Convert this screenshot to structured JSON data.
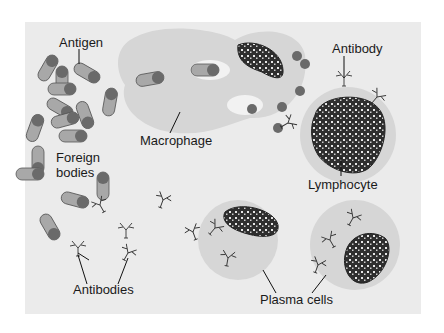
{
  "labels": {
    "antigen": "Antigen",
    "macrophage": "Macrophage",
    "antibody": "Antibody",
    "foreign_bodies_1": "Foreign",
    "foreign_bodies_2": "bodies",
    "lymphocyte": "Lymphocyte",
    "antibodies": "Antibodies",
    "plasma_cells": "Plasma cells"
  },
  "colors": {
    "background": "#ebebeb",
    "cell": "#d6d6d6",
    "bacterium": "#a8a8a8",
    "bacterium_cap": "#6a6a6a",
    "nucleus": "#2e2e2e"
  }
}
